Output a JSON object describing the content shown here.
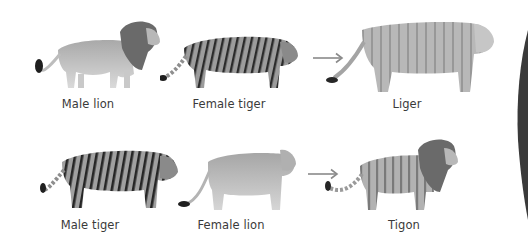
{
  "diagram": {
    "type": "hybrid-crosses",
    "rows": [
      {
        "parents": [
          {
            "id": "male-lion",
            "label": "Male lion"
          },
          {
            "id": "female-tiger",
            "label": "Female tiger"
          }
        ],
        "offspring": {
          "id": "liger",
          "label": "Liger"
        }
      },
      {
        "parents": [
          {
            "id": "male-tiger",
            "label": "Male tiger"
          },
          {
            "id": "female-lion",
            "label": "Female lion"
          }
        ],
        "offspring": {
          "id": "tigon",
          "label": "Tigon"
        }
      }
    ],
    "colors": {
      "background": "#ffffff",
      "label_text": "#3a3a3a",
      "arrow": "#8a8a8a",
      "fur_light": "#c8c8c8",
      "fur_mid": "#a8a8a8",
      "mane_dark": "#5a5a5a",
      "stripe": "#2a2a2a"
    }
  }
}
